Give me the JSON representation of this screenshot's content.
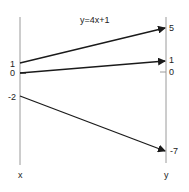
{
  "diagram": {
    "title": "y=4x+1",
    "left_axis": {
      "label": "x",
      "ticks": [
        {
          "label": "1",
          "value": 1
        },
        {
          "label": "0",
          "value": 0
        },
        {
          "label": "-2",
          "value": -2
        }
      ]
    },
    "right_axis": {
      "label": "y",
      "ticks": [
        {
          "label": "5",
          "value": 5
        },
        {
          "label": "1",
          "value": 1
        },
        {
          "label": "0",
          "value": 0
        },
        {
          "label": "-7",
          "value": -7
        }
      ]
    },
    "mappings": [
      {
        "from": "1",
        "to": "5"
      },
      {
        "from": "0",
        "to": "1"
      },
      {
        "from": "-2",
        "to": "-7"
      }
    ],
    "colors": {
      "axis": "#9a9a9a",
      "arrow": "#1a1a1a",
      "text": "#222222"
    }
  }
}
